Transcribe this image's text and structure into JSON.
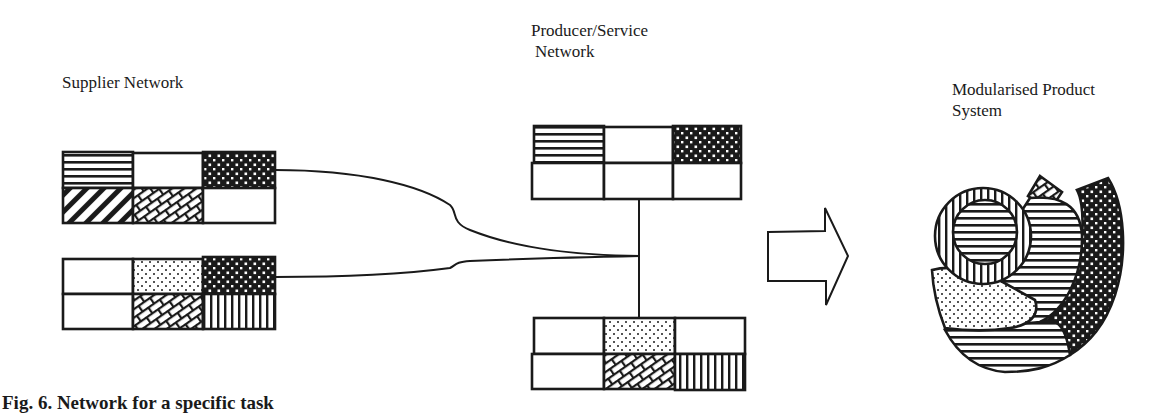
{
  "labels": {
    "supplier_network": "Supplier Network",
    "producer_line1": "Producer/Service",
    "producer_line2": "Network",
    "product_line1": "Modularised Product",
    "product_line2": "System"
  },
  "caption": "Fig. 6.  Network for a specific task",
  "blocks": {
    "supplier_top": {
      "top_row": [
        "horizontal-lines",
        "blank",
        "dark-dots"
      ],
      "bottom_row": [
        "diagonal-stripes",
        "brick",
        "blank"
      ]
    },
    "supplier_bottom": {
      "top_row": [
        "blank",
        "light-dots",
        "dark-dots"
      ],
      "bottom_row": [
        "blank",
        "brick",
        "vertical-lines"
      ]
    },
    "producer_top": {
      "top_row": [
        "horizontal-lines",
        "blank",
        "dark-dots"
      ],
      "bottom_row": [
        "blank",
        "blank",
        "blank"
      ]
    },
    "producer_bottom": {
      "top_row": [
        "blank",
        "light-dots",
        "blank"
      ],
      "bottom_row": [
        "blank",
        "brick",
        "vertical-lines"
      ]
    }
  },
  "arrow": {
    "direction": "right"
  },
  "colors": {
    "ink": "#1a1a1a",
    "paper": "#ffffff"
  }
}
